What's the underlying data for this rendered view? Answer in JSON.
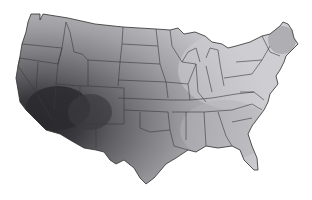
{
  "map": {
    "type": "choropleth",
    "region": "Contiguous United States",
    "colormap": "grayscale",
    "shading_description": "Darkest values concentrated over Arizona, New Mexico, southern Nevada and southern California; gradient lightens toward the Great Lakes, Northeast and Southeast.",
    "colors": {
      "background": "#ffffff",
      "darkest": "#2a2a2e",
      "dark": "#4f4f52",
      "medium": "#7c7c80",
      "light": "#a8a8ac",
      "lightest": "#d6d6da",
      "border": "#3a3a3a"
    },
    "legend": null,
    "title": null
  }
}
